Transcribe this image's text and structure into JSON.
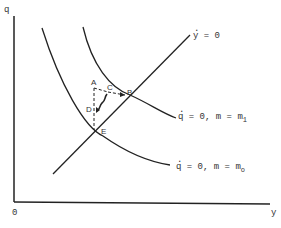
{
  "axes": {
    "y_axis_label": "q",
    "x_axis_label": "y",
    "origin_label": "0"
  },
  "curves": {
    "y_dot_zero": {
      "label_var": "y",
      "label_rest": " = 0"
    },
    "q_dot_zero_m1": {
      "label_var": "q",
      "label_rest": " = 0, m = m",
      "sub": "1"
    },
    "q_dot_zero_m0": {
      "label_var": "q",
      "label_rest": " = 0, m = m",
      "sub": "o"
    }
  },
  "points": {
    "A": "A",
    "B": "B",
    "C": "C",
    "D": "D",
    "E": "E"
  },
  "colors": {
    "line": "#222222",
    "background": "#ffffff"
  }
}
